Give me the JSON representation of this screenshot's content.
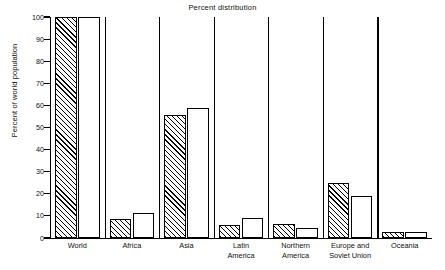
{
  "chart_data": {
    "type": "bar",
    "title": "Percent distribution",
    "xlabel": "",
    "ylabel": "Percent of world population",
    "ylim": [
      0,
      100
    ],
    "yticks": [
      0,
      10,
      20,
      30,
      40,
      50,
      60,
      70,
      80,
      90,
      100
    ],
    "grid": false,
    "legend_position": "none",
    "categories": [
      "World",
      "Africa",
      "Asia",
      "Latin America",
      "Northern America",
      "Europe and Soviet Union",
      "Oceania"
    ],
    "category_lines": [
      [
        "World"
      ],
      [
        "Africa"
      ],
      [
        "Asia"
      ],
      [
        "Latin",
        "America"
      ],
      [
        "Northern",
        "America"
      ],
      [
        "Europe and",
        "Soviet Union"
      ],
      [
        "Oceania"
      ]
    ],
    "series": [
      {
        "name": "hatched",
        "style": "diagonal-hatch",
        "values": [
          100,
          8.5,
          55.5,
          6.0,
          6.2,
          25.0,
          2.6
        ]
      },
      {
        "name": "white",
        "style": "open",
        "values": [
          100,
          11.5,
          59.0,
          9.0,
          4.7,
          19.0,
          2.6
        ]
      }
    ]
  },
  "colors": {
    "ink": "#000000",
    "background": "#ffffff"
  }
}
